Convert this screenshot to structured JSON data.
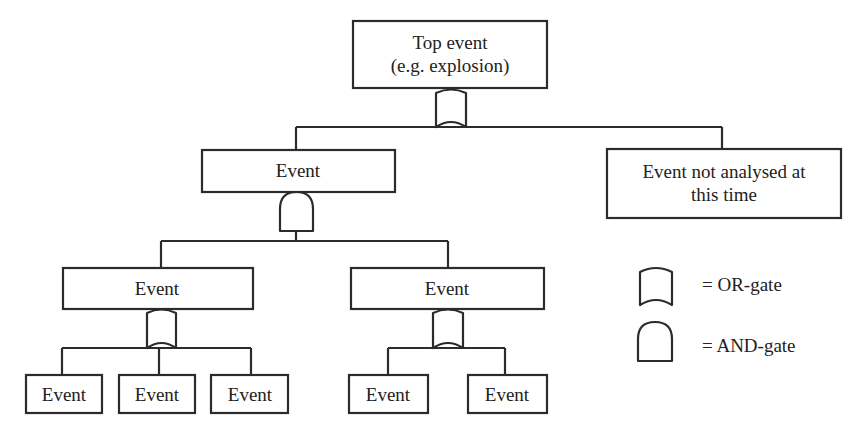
{
  "diagram": {
    "type": "fault-tree",
    "nodes": {
      "top": {
        "lines": [
          "Top event",
          "(e.g. explosion)"
        ]
      },
      "l1_left": {
        "lines": [
          "Event"
        ]
      },
      "l1_right": {
        "lines": [
          "Event not analysed at",
          "this time"
        ]
      },
      "l2_left": {
        "lines": [
          "Event"
        ]
      },
      "l2_right": {
        "lines": [
          "Event"
        ]
      },
      "l3_a": {
        "lines": [
          "Event"
        ]
      },
      "l3_b": {
        "lines": [
          "Event"
        ]
      },
      "l3_c": {
        "lines": [
          "Event"
        ]
      },
      "l3_d": {
        "lines": [
          "Event"
        ]
      },
      "l3_e": {
        "lines": [
          "Event"
        ]
      }
    },
    "gates": {
      "top_gate": {
        "type": "OR",
        "children": [
          "l1_left",
          "l1_right"
        ]
      },
      "l1_left_gate": {
        "type": "AND",
        "children": [
          "l2_left",
          "l2_right"
        ]
      },
      "l2_left_gate": {
        "type": "OR",
        "children": [
          "l3_a",
          "l3_b",
          "l3_c"
        ]
      },
      "l2_right_gate": {
        "type": "OR",
        "children": [
          "l3_d",
          "l3_e"
        ]
      }
    },
    "legend": {
      "or_gate": "= OR-gate",
      "and_gate": "= AND-gate"
    },
    "colors": {
      "stroke": "#2b2b2b",
      "text": "#222222",
      "background": "#ffffff"
    }
  }
}
